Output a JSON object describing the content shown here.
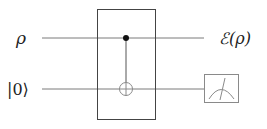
{
  "diagram": {
    "type": "quantum-circuit",
    "inputs": [
      {
        "label": "ρ",
        "wire": "top"
      },
      {
        "label": "|0⟩",
        "wire": "bottom"
      }
    ],
    "outputs": [
      {
        "label": "ℰ(ρ)",
        "wire": "top"
      }
    ],
    "gates": [
      {
        "name": "CNOT",
        "control": "top",
        "target": "bottom"
      },
      {
        "name": "measurement",
        "wire": "bottom"
      }
    ],
    "colors": {
      "wire": "#7a7a7a",
      "box": "#444444",
      "control": "#111111",
      "target": "#8a8a8a",
      "meter": "#8a8a8a",
      "text": "#222222"
    }
  }
}
